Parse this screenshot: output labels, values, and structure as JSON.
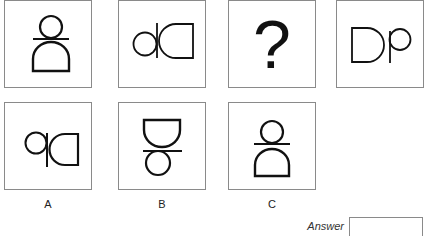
{
  "puzzle": {
    "sequence": [
      {
        "id": "seq-1",
        "glyph": "rotated-Db"
      },
      {
        "id": "seq-2",
        "glyph": "mirrored-dD"
      },
      {
        "id": "seq-3",
        "glyph": "question-mark",
        "text": "?"
      },
      {
        "id": "seq-4",
        "glyph": "Dp"
      }
    ],
    "options": [
      {
        "label": "A",
        "glyph": "mirrored-qD"
      },
      {
        "label": "B",
        "glyph": "inverted-dome-over-circle"
      },
      {
        "label": "C",
        "glyph": "circle-over-dome"
      }
    ],
    "answer": {
      "label": "Answer",
      "value": ""
    }
  },
  "colors": {
    "stroke": "#111111",
    "border": "#8a8a8a"
  }
}
